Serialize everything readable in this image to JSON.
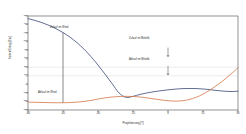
{
  "chart_data": {
    "type": "line",
    "title": "",
    "xlabel": "Projektierung [?]",
    "ylabel": "Kosten/Ertrag [Eur]",
    "xlim": [
      -60,
      30
    ],
    "ylim": [
      -300,
      800
    ],
    "xticks": [
      -60,
      -45,
      -30,
      -15,
      0,
      15,
      30
    ],
    "xticklabels": [
      "-60",
      "-45",
      "-30",
      "-15",
      "0",
      "15",
      "30"
    ],
    "yticks": [
      -300,
      -200,
      -100,
      0,
      100,
      200,
      300,
      400,
      500,
      600,
      700,
      800
    ],
    "yticklabels": [
      "-300",
      "-200",
      "-100",
      "0",
      "100",
      "200",
      "300",
      "400",
      "500",
      "600",
      "700",
      "800"
    ],
    "grid": true,
    "gridlines_y": [
      200,
      100
    ],
    "legend": "none",
    "series": [
      {
        "name": "Zulauf im Wind",
        "color": "#3b4a78",
        "x": [
          -60,
          -57,
          -54,
          -51,
          -48,
          -45,
          -42,
          -39,
          -36,
          -33,
          -30,
          -27,
          -24,
          -21,
          -18,
          -15,
          -12,
          -9,
          -6,
          -3,
          0,
          3,
          6,
          9,
          12,
          15,
          18,
          21,
          24,
          27,
          30
        ],
        "values": [
          770,
          748,
          722,
          690,
          652,
          606,
          552,
          488,
          412,
          324,
          226,
          120,
          10,
          -100,
          -152,
          -140,
          -118,
          -100,
          -86,
          -74,
          -64,
          -56,
          -50,
          -48,
          -49,
          -54,
          -62,
          -72,
          -80,
          -84,
          -80
        ]
      },
      {
        "name": "Ablauf im Wind",
        "color": "#d4764a",
        "x": [
          -60,
          -57,
          -54,
          -51,
          -48,
          -45,
          -42,
          -39,
          -36,
          -33,
          -30,
          -27,
          -24,
          -21,
          -18,
          -15,
          -12,
          -9,
          -6,
          -3,
          0,
          3,
          6,
          9,
          12,
          15,
          18,
          21,
          24,
          27,
          30
        ],
        "values": [
          -208,
          -210,
          -212,
          -214,
          -215,
          -215,
          -213,
          -208,
          -200,
          -188,
          -172,
          -158,
          -148,
          -142,
          -140,
          -142,
          -148,
          -158,
          -170,
          -182,
          -192,
          -196,
          -192,
          -178,
          -152,
          -114,
          -66,
          -10,
          52,
          120,
          195
        ]
      }
    ],
    "connector": {
      "name": "vertical-drop-line",
      "x": -45,
      "y_top": 606,
      "y_bottom": -215,
      "color": "#555555"
    },
    "annotations": [
      {
        "id": "zulauf-wind",
        "text": "Zulauf im Wind",
        "x": -45,
        "y": 660
      },
      {
        "id": "ablauf-wind",
        "text": "Ablauf im Wind",
        "x": -50,
        "y": -180
      },
      {
        "id": "zulauf-mittelb",
        "text": "Zulauf im Mittelb.",
        "x": 0,
        "y": 430,
        "arrow": true
      },
      {
        "id": "ablauf-mittelb",
        "text": "Ablauf im Mittelb.",
        "x": 0,
        "y": 215,
        "arrow": true
      }
    ]
  },
  "axis": {
    "xlabel": "Projektierung [?]",
    "ylabel": "Kosten/Ertrag [Eur]"
  }
}
